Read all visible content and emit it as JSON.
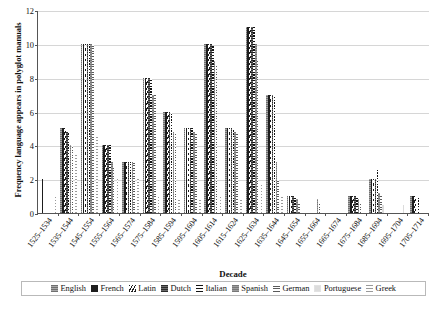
{
  "chart_data": {
    "type": "bar",
    "title": "",
    "xlabel": "Decade",
    "ylabel": "Frequency language appears in polyglot manuals",
    "ylim": [
      0,
      12
    ],
    "yticks": [
      0,
      2,
      4,
      6,
      8,
      10,
      12
    ],
    "grid": true,
    "legend_position": "bottom",
    "categories": [
      "1525–1534",
      "1535–1544",
      "1545–1554",
      "1555–1564",
      "1565–1574",
      "1575–1584",
      "1585–1594",
      "1595–1604",
      "1605–1614",
      "1615–1624",
      "1625–1634",
      "1635–1644",
      "1645–1654",
      "1655–1664",
      "1665–1674",
      "1675–1684",
      "1685–1694",
      "1695–1704",
      "1705–1714"
    ],
    "series": [
      {
        "name": "English",
        "pattern": "horizontal-lines-gray",
        "values": [
          0,
          5,
          10,
          4,
          3,
          8,
          6,
          5,
          10,
          5,
          11,
          7,
          1,
          0,
          0,
          1,
          2,
          0,
          1
        ]
      },
      {
        "name": "French",
        "pattern": "solid-black",
        "values": [
          2,
          5,
          10,
          4,
          3,
          8,
          6,
          5,
          10,
          5,
          11,
          7,
          1,
          0,
          0,
          1,
          2,
          0,
          1
        ]
      },
      {
        "name": "Latin",
        "pattern": "diagonal-hatch",
        "values": [
          0,
          5,
          10,
          4,
          3,
          8,
          6,
          5,
          10,
          5,
          11,
          7,
          1,
          0,
          0,
          1,
          2,
          0,
          1
        ]
      },
      {
        "name": "Dutch",
        "pattern": "dark-gray-lines",
        "values": [
          0,
          4.8,
          10,
          4,
          3,
          8,
          6,
          5,
          10,
          5,
          11,
          7,
          1,
          0,
          0,
          1,
          2,
          0,
          0
        ]
      },
      {
        "name": "Italian",
        "pattern": "heavy-dashed",
        "values": [
          0,
          4.8,
          10,
          4,
          3,
          7.9,
          5.9,
          5,
          9.9,
          4.9,
          11,
          6.9,
          0.9,
          0,
          0,
          0.9,
          2.6,
          0,
          0.9
        ]
      },
      {
        "name": "Spanish",
        "pattern": "light-gray-lines",
        "values": [
          0,
          4,
          10,
          3,
          3,
          7,
          4.8,
          4.8,
          9,
          4.8,
          10,
          3,
          0.8,
          0.8,
          0,
          0.8,
          1.2,
          0,
          0
        ]
      },
      {
        "name": "German",
        "pattern": "thin-dashed",
        "values": [
          0,
          4,
          10,
          2.8,
          3,
          7,
          4.8,
          4.8,
          8.7,
          4.8,
          9,
          2,
          0.6,
          0.6,
          0,
          0.6,
          1,
          0,
          0
        ]
      },
      {
        "name": "Portuguese",
        "pattern": "solid-light",
        "values": [
          0,
          0,
          0,
          0,
          0,
          0,
          0,
          0,
          0,
          0,
          0,
          0,
          0,
          0,
          0,
          0,
          0.5,
          0.5,
          0
        ]
      },
      {
        "name": "Greek",
        "pattern": "dotted",
        "values": [
          1,
          3.5,
          4.5,
          2,
          2,
          1,
          0.9,
          0.9,
          1,
          0.9,
          1.8,
          1,
          0,
          0,
          0,
          0,
          0,
          0,
          0
        ]
      }
    ]
  },
  "axes": {
    "ylabel": "Frequency language appears in polyglot manuals",
    "xlabel": "Decade"
  },
  "legend": {
    "items": [
      {
        "label": "English",
        "swatch": "sw-english"
      },
      {
        "label": "French",
        "swatch": "sw-french"
      },
      {
        "label": "Latin",
        "swatch": "sw-latin"
      },
      {
        "label": "Dutch",
        "swatch": "sw-dutch"
      },
      {
        "label": "Italian",
        "swatch": "sw-italian"
      },
      {
        "label": "Spanish",
        "swatch": "sw-spanish"
      },
      {
        "label": "German",
        "swatch": "sw-german"
      },
      {
        "label": "Portuguese",
        "swatch": "sw-portuguese"
      },
      {
        "label": "Greek",
        "swatch": "sw-greek"
      }
    ]
  },
  "caption": {
    "text": ""
  },
  "colors": {
    "grid": "#d6d6d6",
    "axis": "#555555",
    "text": "#111111"
  }
}
